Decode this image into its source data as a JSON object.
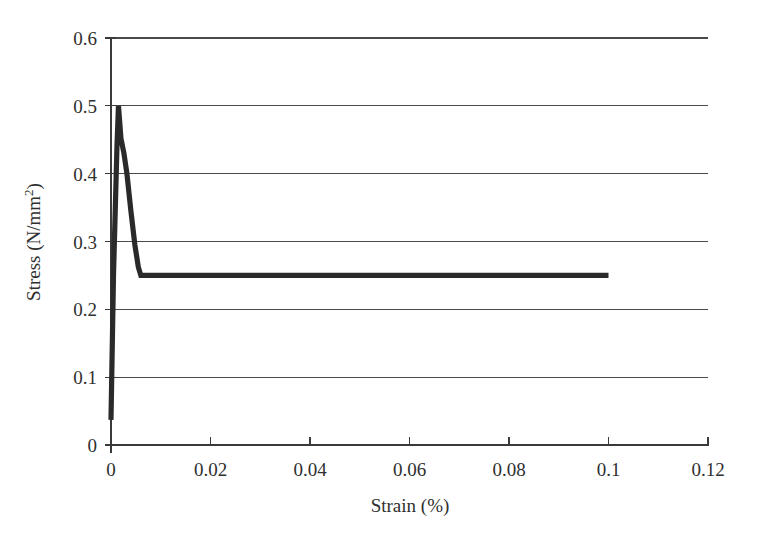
{
  "chart_data": {
    "type": "line",
    "title": "",
    "xlabel": "Strain (%)",
    "ylabel": "Stress (N/mm2)",
    "ylabel_base": "Stress (N/mm",
    "ylabel_sup": "2",
    "ylabel_tail": ")",
    "xlim": [
      0,
      0.12
    ],
    "ylim": [
      0,
      0.6
    ],
    "grid": "horizontal",
    "legend": "none",
    "series": [
      {
        "name": "stress-strain",
        "x": [
          0.0,
          0.0005,
          0.0012,
          0.0015,
          0.002,
          0.0026,
          0.0032,
          0.004,
          0.0048,
          0.0055,
          0.006,
          0.1
        ],
        "y": [
          0.037,
          0.25,
          0.44,
          0.5,
          0.452,
          0.43,
          0.4,
          0.345,
          0.295,
          0.262,
          0.25,
          0.25
        ]
      }
    ],
    "x_ticks": [
      {
        "value": 0,
        "label": "0"
      },
      {
        "value": 0.02,
        "label": "0.02"
      },
      {
        "value": 0.04,
        "label": "0.04"
      },
      {
        "value": 0.06,
        "label": "0.06"
      },
      {
        "value": 0.08,
        "label": "0.08"
      },
      {
        "value": 0.1,
        "label": "0.1"
      },
      {
        "value": 0.12,
        "label": "0.12"
      }
    ],
    "y_ticks": [
      {
        "value": 0,
        "label": "0"
      },
      {
        "value": 0.1,
        "label": "0.1"
      },
      {
        "value": 0.2,
        "label": "0.2"
      },
      {
        "value": 0.3,
        "label": "0.3"
      },
      {
        "value": 0.4,
        "label": "0.4"
      },
      {
        "value": 0.5,
        "label": "0.5"
      },
      {
        "value": 0.6,
        "label": "0.6"
      }
    ],
    "colors": {
      "line": "#2a2a2a",
      "grid": "#4a4a4a",
      "axis": "#3a3a3a",
      "background": "#ffffff",
      "text": "#2f2f2f"
    },
    "peak": {
      "x": 0.0015,
      "y": 0.5
    },
    "plateau": {
      "y": 0.25,
      "x_start": 0.006,
      "x_end": 0.1
    }
  }
}
